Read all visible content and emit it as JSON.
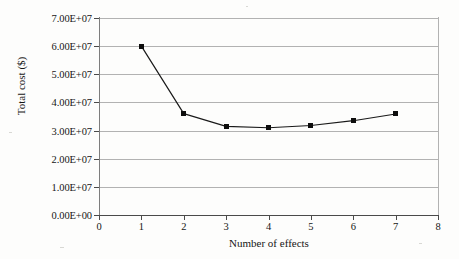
{
  "chart_data": {
    "type": "line",
    "title": "",
    "subtitle": "",
    "xlabel": "Number of effects",
    "ylabel": "Total cost ($)",
    "x": [
      1,
      2,
      3,
      4,
      5,
      6,
      7
    ],
    "values": [
      60000000,
      36000000,
      31500000,
      31000000,
      31800000,
      33500000,
      35900000
    ],
    "series": [
      {
        "name": "Total cost",
        "x": [
          1,
          2,
          3,
          4,
          5,
          6,
          7
        ],
        "values": [
          60000000,
          36000000,
          31500000,
          31000000,
          31800000,
          33500000,
          35900000
        ]
      }
    ],
    "xlim": [
      0,
      8
    ],
    "ylim": [
      0,
      70000000
    ],
    "xticks": [
      0,
      1,
      2,
      3,
      4,
      5,
      6,
      7,
      8
    ],
    "xtick_labels": [
      "0",
      "1",
      "2",
      "3",
      "4",
      "5",
      "6",
      "7",
      "8"
    ],
    "yticks": [
      0,
      10000000,
      20000000,
      30000000,
      40000000,
      50000000,
      60000000,
      70000000
    ],
    "ytick_labels": [
      "0.00E+00",
      "1.00E+07",
      "2.00E+07",
      "3.00E+07",
      "4.00E+07",
      "5.00E+07",
      "6.00E+07",
      "7.00E+07"
    ],
    "grid": "horizontal",
    "legend": "none",
    "marker": "square",
    "marker_color": "#0d0d0d",
    "line_color": "#1a1a1a",
    "grid_color": "#b2b2b2",
    "axis_color": "#4a4a4a",
    "background": "#fdfdfc",
    "annotations": []
  }
}
